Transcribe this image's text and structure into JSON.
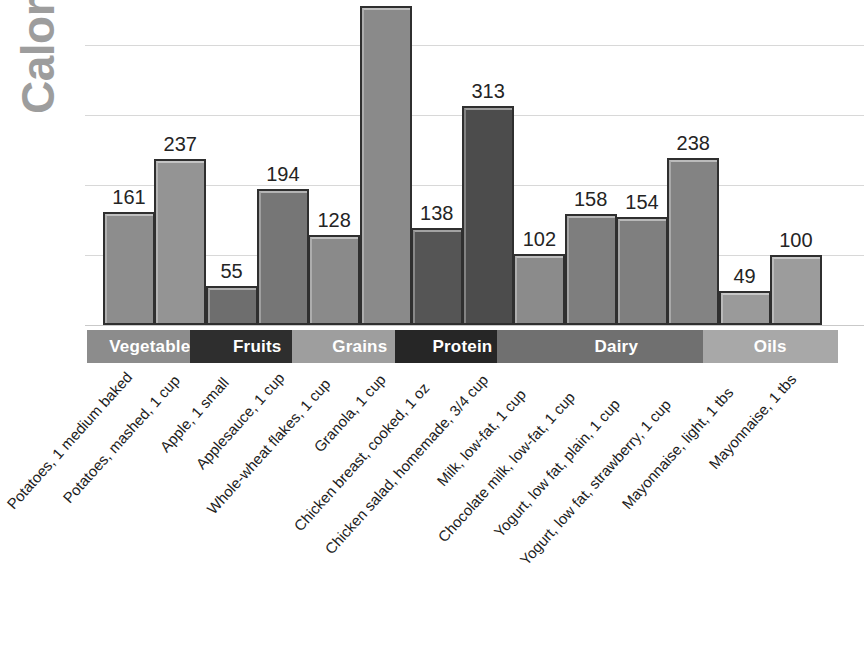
{
  "chart_data": {
    "type": "bar",
    "title": "",
    "ylabel": "Calories",
    "xlabel": "",
    "ylim": [
      0,
      455
    ],
    "grid": true,
    "gridline_values": [
      100,
      200,
      300,
      400
    ],
    "legend": "none",
    "note_clipped_bar": "Granola, 1 cup bar extends above the top edge of the image; its value label is not visible",
    "categories": [
      "Potatoes, 1 medium baked",
      "Potatoes, mashed, 1 cup",
      "Apple, 1 small",
      "Applesauce, 1 cup",
      "Whole-wheat flakes, 1 cup",
      "Granola, 1 cup",
      "Chicken breast, cooked, 1 oz",
      "Chicken salad, homemade, 3/4 cup",
      "Milk, low-fat, 1 cup",
      "Chocolate milk, low-fat, 1 cup",
      "Yogurt, low fat, plain, 1 cup",
      "Yogurt, low fat, strawberry, 1 cup",
      "Mayonnaise, light, 1 tbs",
      "Mayonnaise, 1 tbs"
    ],
    "values": [
      161,
      237,
      55,
      194,
      128,
      455,
      138,
      313,
      102,
      158,
      154,
      238,
      49,
      100
    ],
    "value_labels": [
      "161",
      "237",
      "55",
      "194",
      "128",
      "",
      "138",
      "313",
      "102",
      "158",
      "154",
      "238",
      "49",
      "100"
    ],
    "groups": [
      {
        "label": "Vegetables",
        "count": 2,
        "color": "#8c8c8c"
      },
      {
        "label": "Fruits",
        "count": 2,
        "color": "#2e2e2e"
      },
      {
        "label": "Grains",
        "count": 2,
        "color": "#9e9e9e"
      },
      {
        "label": "Protein",
        "count": 2,
        "color": "#262626"
      },
      {
        "label": "Dairy",
        "count": 4,
        "color": "#707070"
      },
      {
        "label": "Oils",
        "count": 2,
        "color": "#a8a8a8"
      }
    ],
    "bar_colors": [
      "#8d8d8d",
      "#949494",
      "#6e6e6e",
      "#767676",
      "#8a8a8a",
      "#8a8a8a",
      "#555555",
      "#4c4c4c",
      "#8b8b8b",
      "#7e7e7e",
      "#7f7f7f",
      "#838383",
      "#9a9a9a",
      "#9c9c9c"
    ]
  },
  "colors": {
    "axis_title": "#9d9d9d",
    "gridline": "#d8d8d8",
    "bar_outline": "#2f2f2f",
    "value_text": "#242424",
    "band_text": "#ffffff",
    "background": "#ffffff"
  }
}
